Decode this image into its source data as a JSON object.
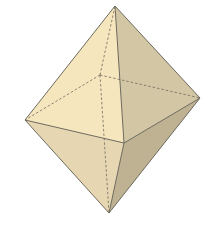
{
  "figure": {
    "vertices": {
      "top": [
        115,
        6
      ],
      "left": [
        25,
        120
      ],
      "front": [
        124,
        143
      ],
      "right": [
        200,
        98
      ],
      "back": [
        100,
        75
      ],
      "bottom": [
        109,
        213
      ]
    },
    "colors": {
      "background": "#ffffff",
      "face_upper_left": "#f6e6bd",
      "face_upper_right": "#d3c6a4",
      "face_lower_left": "#e6d7b2",
      "face_lower_right": "#bfb293",
      "edge": "#6e6a5e",
      "hidden_edge": "#6e6a5e"
    }
  }
}
